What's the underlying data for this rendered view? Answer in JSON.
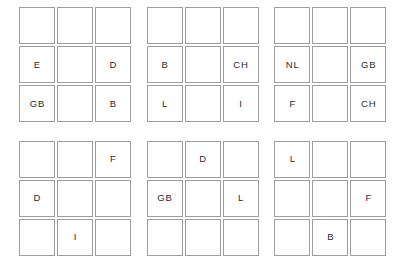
{
  "page": {
    "background_color": "#ffffff",
    "cell_border_color": "#9e9e9e",
    "text_color": "#2b2b2b"
  },
  "layout": {
    "grid_blocks_across": 3,
    "grid_blocks_down": 2,
    "cells_per_block_across": 3,
    "cells_per_block_down": 3
  },
  "grids": [
    {
      "name": "grid-1",
      "position": "top-left",
      "rows": [
        [
          "",
          "",
          ""
        ],
        [
          "E",
          "",
          "D"
        ],
        [
          "GB",
          "",
          "B"
        ]
      ]
    },
    {
      "name": "grid-2",
      "position": "top-center",
      "rows": [
        [
          "",
          "",
          ""
        ],
        [
          "B",
          "",
          "CH"
        ],
        [
          "L",
          "",
          "I"
        ]
      ]
    },
    {
      "name": "grid-3",
      "position": "top-right",
      "rows": [
        [
          "",
          "",
          ""
        ],
        [
          "NL",
          "",
          "GB"
        ],
        [
          "F",
          "",
          "CH"
        ]
      ]
    },
    {
      "name": "grid-4",
      "position": "bottom-left",
      "rows": [
        [
          "",
          "",
          "F"
        ],
        [
          "D",
          "",
          ""
        ],
        [
          "",
          "I",
          ""
        ]
      ]
    },
    {
      "name": "grid-5",
      "position": "bottom-center",
      "rows": [
        [
          "",
          "D",
          ""
        ],
        [
          "GB",
          "",
          "L"
        ],
        [
          "",
          "",
          ""
        ]
      ]
    },
    {
      "name": "grid-6",
      "position": "bottom-right",
      "rows": [
        [
          "L",
          "",
          ""
        ],
        [
          "",
          "",
          "F"
        ],
        [
          "",
          "B",
          ""
        ]
      ]
    }
  ]
}
